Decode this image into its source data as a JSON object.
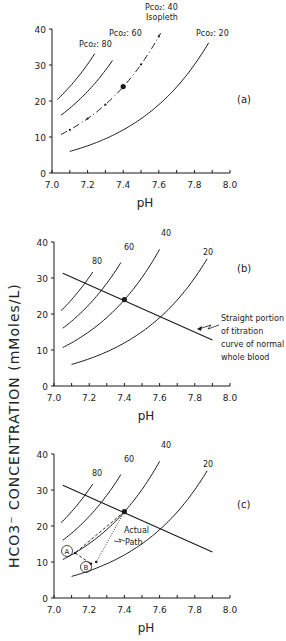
{
  "chart_data": [
    {
      "panel": "(a)",
      "type": "line",
      "xlabel": "pH",
      "ylabel": "HCO3- CONCENTRATION (mMoles/L)",
      "xlim": [
        7.0,
        8.0
      ],
      "ylim": [
        0,
        40
      ],
      "xticks": [
        "7.0",
        "7.2",
        "7.4",
        "7.6",
        "7.8",
        "8.0"
      ],
      "yticks": [
        "0",
        "10",
        "20",
        "30",
        "40"
      ],
      "series": [
        {
          "name": "PCO2 = 80",
          "pco2": 80,
          "x": [
            7.03,
            7.08,
            7.13,
            7.18,
            7.23
          ],
          "y": [
            20.6,
            23.1,
            25.9,
            29.1,
            32.6
          ]
        },
        {
          "name": "PCO2 = 60",
          "pco2": 60,
          "x": [
            7.05,
            7.12,
            7.19,
            7.26,
            7.33
          ],
          "y": [
            16.0,
            18.8,
            22.1,
            26.0,
            30.5
          ]
        },
        {
          "name": "PCO2 = 40 Isopleth",
          "pco2": 40,
          "style": "dash-dot",
          "x": [
            7.05,
            7.1,
            7.2,
            7.3,
            7.4,
            7.5,
            7.6
          ],
          "y": [
            10.7,
            12.0,
            15.1,
            19.0,
            24.0,
            30.1,
            37.9
          ]
        },
        {
          "name": "PCO2 = 20",
          "pco2": 20,
          "x": [
            7.1,
            7.3,
            7.5,
            7.7,
            7.87
          ],
          "y": [
            6.0,
            9.5,
            15.1,
            23.9,
            35.3
          ]
        }
      ],
      "points": [
        {
          "label": "normal",
          "x": 7.4,
          "y": 24
        }
      ],
      "annotations": [
        "PCO2: 80",
        "PCO2: 60",
        "PCO2: 40",
        "Isopleth",
        "PCO2: 20"
      ]
    },
    {
      "panel": "(b)",
      "type": "line",
      "xlabel": "pH",
      "xlim": [
        7.0,
        8.0
      ],
      "ylim": [
        0,
        40
      ],
      "xticks": [
        "7.0",
        "7.2",
        "7.4",
        "7.6",
        "7.8",
        "8.0"
      ],
      "yticks": [
        "0",
        "10",
        "20",
        "30",
        "40"
      ],
      "series": [
        {
          "name": "80",
          "pco2": 80
        },
        {
          "name": "60",
          "pco2": 60
        },
        {
          "name": "40",
          "pco2": 40
        },
        {
          "name": "20",
          "pco2": 20
        },
        {
          "name": "titration line",
          "x": [
            7.05,
            7.9
          ],
          "y": [
            31.3,
            12.8
          ]
        }
      ],
      "points": [
        {
          "label": "normal",
          "x": 7.4,
          "y": 24
        }
      ],
      "annotations": [
        "Straight portion",
        "of titration",
        "curve of normal",
        "whole blood"
      ]
    },
    {
      "panel": "(c)",
      "type": "line",
      "xlabel": "pH",
      "xlim": [
        7.0,
        8.0
      ],
      "ylim": [
        0,
        40
      ],
      "xticks": [
        "7.0",
        "7.2",
        "7.4",
        "7.6",
        "7.8",
        "8.0"
      ],
      "yticks": [
        "0",
        "10",
        "20",
        "30",
        "40"
      ],
      "series": [
        {
          "name": "80",
          "pco2": 80
        },
        {
          "name": "60",
          "pco2": 60
        },
        {
          "name": "40",
          "pco2": 40
        },
        {
          "name": "20",
          "pco2": 20
        },
        {
          "name": "titration line",
          "x": [
            7.05,
            7.9
          ],
          "y": [
            31.3,
            12.8
          ]
        },
        {
          "name": "path A",
          "style": "dashed",
          "x": [
            7.4,
            7.12
          ],
          "y": [
            24,
            12.5
          ]
        },
        {
          "name": "path A to B",
          "style": "dashed",
          "x": [
            7.12,
            7.21
          ],
          "y": [
            12.5,
            9.5
          ]
        },
        {
          "name": "actual path",
          "style": "dotted",
          "x": [
            7.4,
            7.24
          ],
          "y": [
            24,
            10
          ]
        }
      ],
      "points": [
        {
          "label": "normal",
          "x": 7.4,
          "y": 24
        }
      ],
      "annotations": [
        "A",
        "B",
        "Actual",
        "Path"
      ]
    }
  ],
  "labels": {
    "y_axis": "HCO3⁻  CONCENTRATION  (mMoles/L)",
    "x_axis": "pH",
    "panel_a": "(a)",
    "panel_b": "(b)",
    "panel_c": "(c)",
    "a_p80": "Pco₂: 80",
    "a_p60": "Pco₂: 60",
    "a_p40": "Pco₂: 40",
    "a_iso": "Isopleth",
    "a_p20": "Pco₂: 20",
    "iso80": "80",
    "iso60": "60",
    "iso40": "40",
    "iso20": "20",
    "note1": "Straight portion",
    "note2": "of titration",
    "note3": "curve of normal",
    "note4": "whole blood",
    "markA": "A",
    "markB": "B",
    "actual1": "Actual",
    "actual2": "Path"
  },
  "colors": {
    "ink": "#1a1a1a",
    "paper": "#ffffff"
  }
}
